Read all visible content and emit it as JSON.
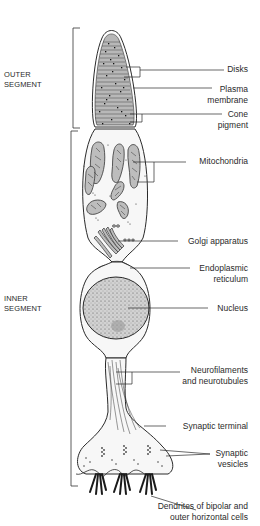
{
  "sections": [
    {
      "id": "outer",
      "line1": "OUTER",
      "line2": "SEGMENT"
    },
    {
      "id": "inner",
      "line1": "INNER",
      "line2": "SEGMENT"
    }
  ],
  "labels": {
    "disks": {
      "line1": "Disks"
    },
    "plasma_membrane": {
      "line1": "Plasma",
      "line2": "membrane"
    },
    "cone_pigment": {
      "line1": "Cone",
      "line2": "pigment"
    },
    "mitochondria": {
      "line1": "Mitochondria"
    },
    "golgi": {
      "line1": "Golgi apparatus"
    },
    "er": {
      "line1": "Endoplasmic",
      "line2": "reticulum"
    },
    "nucleus": {
      "line1": "Nucleus"
    },
    "neurofilaments": {
      "line1": "Neurofilaments",
      "line2": "and neurotubules"
    },
    "synaptic_terminal": {
      "line1": "Synaptic terminal"
    },
    "synaptic_vesicles": {
      "line1": "Synaptic",
      "line2": "vesicles"
    },
    "dendrites": {
      "line1": "Dendrites of bipolar and",
      "line2": "outer horizontal cells"
    }
  },
  "colors": {
    "line": "#2a2a2a",
    "disk_fill": "#b8b8b8",
    "cell_fill": "#f6f6f6",
    "nucleus_fill": "#c9c9c9"
  }
}
